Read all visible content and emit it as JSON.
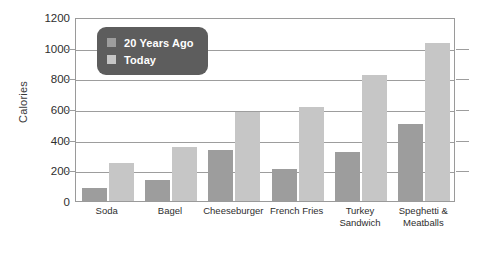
{
  "chart_data": {
    "type": "bar",
    "title": "",
    "xlabel": "",
    "ylabel": "Calories",
    "ylim": [
      0,
      1200
    ],
    "ytick_step": 200,
    "yticks": [
      0,
      200,
      400,
      600,
      800,
      1000,
      1200
    ],
    "ytick_labels": [
      "0",
      "200",
      "400",
      "600",
      "800",
      "1000",
      "1200"
    ],
    "grid": true,
    "legend_position": "upper-left-inside",
    "categories": [
      "Soda",
      "Bagel",
      "Cheeseburger",
      "French Fries",
      "Turkey\nSandwich",
      "Speghetti &\nMeatballs"
    ],
    "series": [
      {
        "name": "20 Years Ago",
        "color": "#9d9d9d",
        "values": [
          85,
          140,
          335,
          210,
          320,
          500
        ]
      },
      {
        "name": "Today",
        "color": "#c6c6c6",
        "values": [
          250,
          350,
          580,
          610,
          820,
          1030
        ]
      }
    ]
  },
  "legend": {
    "entries": [
      {
        "label": "20 Years Ago",
        "swatch_color": "#9d9d9d"
      },
      {
        "label": "Today",
        "swatch_color": "#c6c6c6"
      }
    ],
    "background_color": "#5d5d5d",
    "text_color": "#ffffff"
  },
  "axes": {
    "y_title": "Calories",
    "frame_color": "#9a9a9a",
    "gridline_color": "#9d9d9d"
  }
}
